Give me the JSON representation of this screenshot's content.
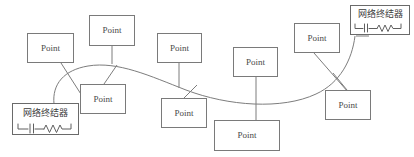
{
  "diagram": {
    "canvas": {
      "width": 414,
      "height": 157,
      "background": "#ffffff"
    },
    "colors": {
      "box_stroke": "#7a7a7a",
      "line_stroke": "#7d7d7d",
      "symbol_stroke": "#5f5f5f",
      "text": "#4a4a4a",
      "background": "#ffffff"
    },
    "nodes": [
      {
        "id": "point-1",
        "label": "Point",
        "x": 27,
        "y": 33,
        "w": 47,
        "h": 30
      },
      {
        "id": "point-2",
        "label": "Point",
        "x": 89,
        "y": 15,
        "w": 46,
        "h": 31
      },
      {
        "id": "point-3",
        "label": "Point",
        "x": 80,
        "y": 84,
        "w": 46,
        "h": 30
      },
      {
        "id": "point-4",
        "label": "Point",
        "x": 157,
        "y": 33,
        "w": 45,
        "h": 30
      },
      {
        "id": "point-5",
        "label": "Point",
        "x": 161,
        "y": 98,
        "w": 46,
        "h": 30
      },
      {
        "id": "point-6",
        "label": "Point",
        "x": 233,
        "y": 47,
        "w": 45,
        "h": 30
      },
      {
        "id": "point-7",
        "label": "Point",
        "x": 214,
        "y": 120,
        "w": 66,
        "h": 31
      },
      {
        "id": "point-8",
        "label": "Point",
        "x": 294,
        "y": 23,
        "w": 46,
        "h": 30
      },
      {
        "id": "point-9",
        "label": "Point",
        "x": 325,
        "y": 90,
        "w": 46,
        "h": 30
      }
    ],
    "terminators": [
      {
        "id": "terminator-left",
        "label": "网络终结器",
        "x": 12,
        "y": 103,
        "w": 67,
        "h": 32,
        "symbol": "capacitor-resistor-symbol"
      },
      {
        "id": "terminator-right",
        "label": "网络终结器",
        "x": 350,
        "y": 5,
        "w": 60,
        "h": 30,
        "symbol": "capacitor-resistor-symbol"
      }
    ],
    "bus": {
      "name": "network-backbone",
      "path": "M 54 103 C 52 80 70 67 100 66 C 140 64 168 84 205 95 C 250 108 300 108 330 85 C 348 71 355 52 356 35"
    },
    "drop_lines": [
      {
        "id": "drop-point-1",
        "path": "M 62 63 L 86 101"
      },
      {
        "id": "drop-point-2",
        "path": "M 112 46 L 112 66"
      },
      {
        "id": "drop-point-3",
        "path": "M 104 84 L 118 66"
      },
      {
        "id": "drop-point-4",
        "path": "M 179 63 L 179 98"
      },
      {
        "id": "drop-point-5",
        "path": "M 184 98 L 196 92"
      },
      {
        "id": "drop-point-6",
        "path": "M 256 77 L 256 120"
      },
      {
        "id": "drop-point-7",
        "path": "M 247 120 L 247 106"
      },
      {
        "id": "drop-point-8",
        "path": "M 314 53 L 348 90"
      },
      {
        "id": "drop-point-9",
        "path": "M 348 90 L 338 76"
      }
    ]
  }
}
